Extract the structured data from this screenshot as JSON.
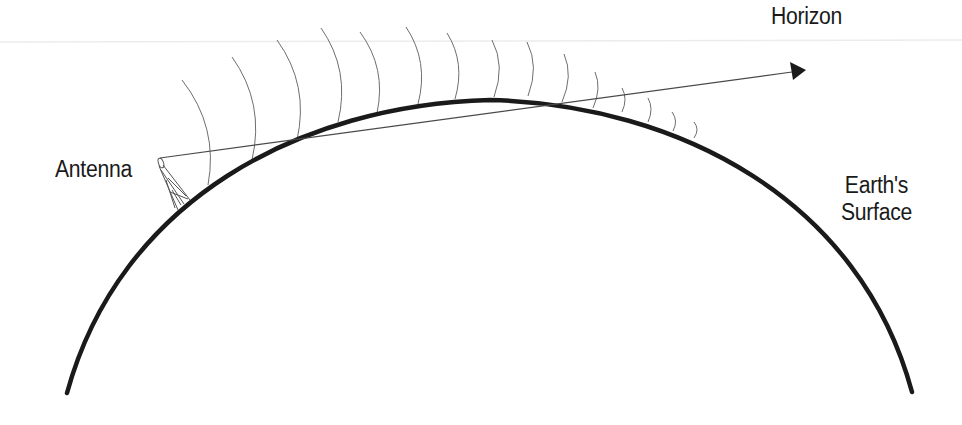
{
  "diagram": {
    "labels": {
      "horizon": "Horizon",
      "antenna": "Antenna",
      "earth_line1": "Earth's",
      "earth_line2": "Surface"
    },
    "colors": {
      "background": "#ffffff",
      "earth_surface": "#1a1a1a",
      "wave_lines": "#6e6e6e",
      "horizon_line": "#4a4a4a",
      "text": "#1a1a1a",
      "faint_rule": "#ececec"
    },
    "elements": {
      "earth_arc": {
        "start": [
          67,
          393
        ],
        "apex": [
          490,
          100
        ],
        "end": [
          912,
          392
        ]
      },
      "antenna_tip": [
        160,
        158
      ],
      "antenna_base": [
        180,
        208
      ],
      "horizon_arrow": {
        "from": [
          160,
          158
        ],
        "to": [
          806,
          70
        ]
      },
      "wave_fronts": [
        [
          [
            182,
            80
          ],
          [
            208,
            185
          ]
        ],
        [
          [
            232,
            57
          ],
          [
            252,
            160
          ]
        ],
        [
          [
            277,
            40
          ],
          [
            297,
            140
          ]
        ],
        [
          [
            321,
            28
          ],
          [
            338,
            122
          ]
        ],
        [
          [
            360,
            32
          ],
          [
            377,
            113
          ]
        ],
        [
          [
            406,
            27
          ],
          [
            418,
            104
          ]
        ],
        [
          [
            447,
            33
          ],
          [
            455,
            99
          ]
        ],
        [
          [
            492,
            40
          ],
          [
            494,
            97
          ]
        ],
        [
          [
            527,
            42
          ],
          [
            528,
            96
          ]
        ],
        [
          [
            564,
            54
          ],
          [
            562,
            102
          ]
        ],
        [
          [
            595,
            72
          ],
          [
            593,
            108
          ]
        ],
        [
          [
            622,
            88
          ],
          [
            622,
            112
          ]
        ],
        [
          [
            648,
            98
          ],
          [
            648,
            122
          ]
        ],
        [
          [
            672,
            112
          ],
          [
            673,
            131
          ]
        ],
        [
          [
            694,
            122
          ],
          [
            694,
            138
          ]
        ]
      ]
    }
  }
}
